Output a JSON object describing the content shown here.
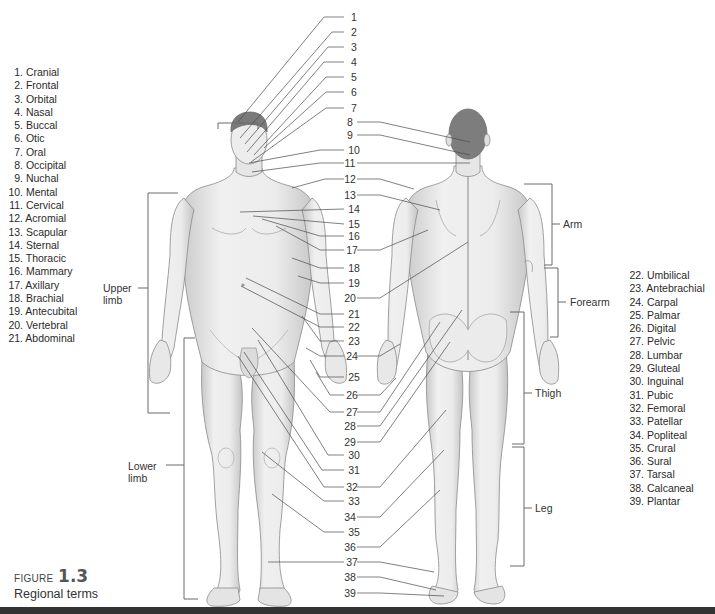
{
  "figure": {
    "label_word": "FIGURE",
    "label_number": "1.3",
    "title": "Regional terms"
  },
  "legend_left": [
    {
      "n": "1.",
      "term": "Cranial"
    },
    {
      "n": "2.",
      "term": "Frontal"
    },
    {
      "n": "3.",
      "term": "Orbital"
    },
    {
      "n": "4.",
      "term": "Nasal"
    },
    {
      "n": "5.",
      "term": "Buccal"
    },
    {
      "n": "6.",
      "term": "Otic"
    },
    {
      "n": "7.",
      "term": "Oral"
    },
    {
      "n": "8.",
      "term": "Occipital"
    },
    {
      "n": "9.",
      "term": "Nuchal"
    },
    {
      "n": "10.",
      "term": "Mental"
    },
    {
      "n": "11.",
      "term": "Cervical"
    },
    {
      "n": "12.",
      "term": "Acromial"
    },
    {
      "n": "13.",
      "term": "Scapular"
    },
    {
      "n": "14.",
      "term": "Sternal"
    },
    {
      "n": "15.",
      "term": "Thoracic"
    },
    {
      "n": "16.",
      "term": "Mammary"
    },
    {
      "n": "17.",
      "term": "Axillary"
    },
    {
      "n": "18.",
      "term": "Brachial"
    },
    {
      "n": "19.",
      "term": "Antecubital"
    },
    {
      "n": "20.",
      "term": "Vertebral"
    },
    {
      "n": "21.",
      "term": "Abdominal"
    }
  ],
  "legend_right": [
    {
      "n": "22.",
      "term": "Umbilical"
    },
    {
      "n": "23.",
      "term": "Antebrachial"
    },
    {
      "n": "24.",
      "term": "Carpal"
    },
    {
      "n": "25.",
      "term": "Palmar"
    },
    {
      "n": "26.",
      "term": "Digital"
    },
    {
      "n": "27.",
      "term": "Pelvic"
    },
    {
      "n": "28.",
      "term": "Lumbar"
    },
    {
      "n": "29.",
      "term": "Gluteal"
    },
    {
      "n": "30.",
      "term": "Inguinal"
    },
    {
      "n": "31.",
      "term": "Pubic"
    },
    {
      "n": "32.",
      "term": "Femoral"
    },
    {
      "n": "33.",
      "term": "Patellar"
    },
    {
      "n": "34.",
      "term": "Popliteal"
    },
    {
      "n": "35.",
      "term": "Crural"
    },
    {
      "n": "36.",
      "term": "Sural"
    },
    {
      "n": "37.",
      "term": "Tarsal"
    },
    {
      "n": "38.",
      "term": "Calcaneal"
    },
    {
      "n": "39.",
      "term": "Plantar"
    }
  ],
  "center_numbers": [
    "1",
    "2",
    "3",
    "4",
    "5",
    "6",
    "7",
    "8",
    "9",
    "10",
    "11",
    "12",
    "13",
    "14",
    "15",
    "16",
    "17",
    "18",
    "19",
    "20",
    "21",
    "22",
    "23",
    "24",
    "25",
    "26",
    "27",
    "28",
    "29",
    "30",
    "31",
    "32",
    "33",
    "34",
    "35",
    "36",
    "37",
    "38",
    "39"
  ],
  "brackets": {
    "upper_limb": "Upper\nlimb",
    "upper_limb_line1": "Upper",
    "upper_limb_line2": "limb",
    "lower_limb_line1": "Lower",
    "lower_limb_line2": "limb",
    "arm": "Arm",
    "forearm": "Forearm",
    "thigh": "Thigh",
    "leg": "Leg"
  },
  "colors": {
    "skin_light": "#efefef",
    "skin_shade": "#c9c9c9",
    "outline": "#8a8a8a",
    "hair": "#7a7a7a",
    "leader_line": "#4a4a4a",
    "text": "#2a2a2a",
    "bottom_bar": "#333333"
  }
}
